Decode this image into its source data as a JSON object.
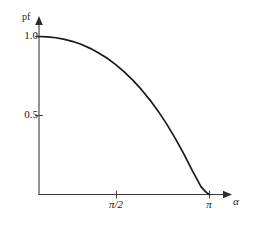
{
  "chart_data": {
    "type": "line",
    "title": "",
    "subtitle": "",
    "xlabel": "α",
    "ylabel": "pf",
    "grid": false,
    "legend": false,
    "legend_position": "none",
    "xlim": [
      0,
      3.665
    ],
    "ylim": [
      0,
      1.12
    ],
    "x_tick_labels": [
      "π/2",
      "π"
    ],
    "x_tick_values": [
      1.5708,
      3.1416
    ],
    "y_tick_labels": [
      "0.5",
      "1.0"
    ],
    "y_tick_values": [
      0.5,
      1.0
    ],
    "annotations": [],
    "series": [
      {
        "name": "pf",
        "x": [
          0.0,
          0.1571,
          0.3142,
          0.4712,
          0.6283,
          0.7854,
          0.9425,
          1.0996,
          1.2566,
          1.4137,
          1.5708,
          1.7279,
          1.885,
          2.042,
          2.1991,
          2.3562,
          2.5133,
          2.6704,
          2.8274,
          2.9845,
          3.0631,
          3.1024,
          3.1416
        ],
        "values": [
          1.0,
          0.998,
          0.992,
          0.982,
          0.968,
          0.949,
          0.925,
          0.896,
          0.862,
          0.822,
          0.776,
          0.724,
          0.665,
          0.599,
          0.526,
          0.444,
          0.354,
          0.256,
          0.15,
          0.05,
          0.02,
          0.008,
          0.0
        ]
      }
    ]
  },
  "labels": {
    "y_axis_name": "pf",
    "x_axis_name": "α",
    "y_tick_top": "1.0",
    "y_tick_mid": "0.5",
    "x_tick_half_pi": "π/2",
    "x_tick_pi": "π"
  },
  "colors": {
    "curve": "#191919",
    "axis": "#3a3a3a",
    "background": "#ffffff",
    "text": "#1c1c1c"
  }
}
